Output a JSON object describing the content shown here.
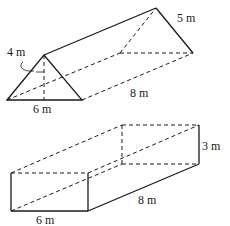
{
  "prism": {
    "height_label": "4 m",
    "base_label": "6 m",
    "slant_label": "5 m",
    "length_label": "8 m"
  },
  "box": {
    "height_label": "3 m",
    "width_label": "6 m",
    "length_label": "8 m"
  }
}
